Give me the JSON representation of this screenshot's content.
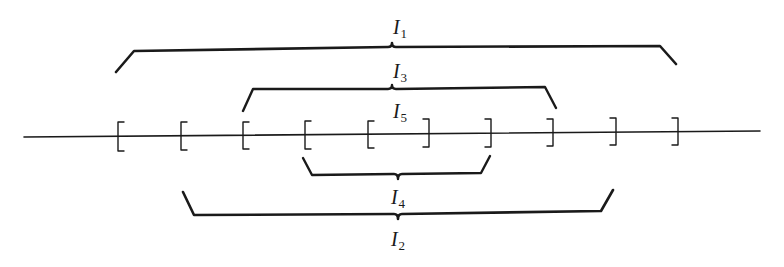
{
  "diagram": {
    "axis": {
      "x1": 24,
      "y1": 137,
      "x2": 760,
      "y2": 131
    },
    "left_brackets": [
      {
        "x": 118
      },
      {
        "x": 181
      },
      {
        "x": 243
      },
      {
        "x": 305
      },
      {
        "x": 368
      }
    ],
    "right_brackets": [
      {
        "x": 429
      },
      {
        "x": 491
      },
      {
        "x": 553
      },
      {
        "x": 616
      },
      {
        "x": 678
      }
    ],
    "intervals": [
      {
        "id": "I1",
        "name": "I",
        "sub": "1",
        "side": "above",
        "x_start": 116,
        "x_end": 676,
        "label_x": 400,
        "label_y": 28
      },
      {
        "id": "I3",
        "name": "I",
        "sub": "3",
        "side": "above",
        "x_start": 243,
        "x_end": 555,
        "label_x": 400,
        "label_y": 72
      },
      {
        "id": "I5",
        "name": "I",
        "sub": "5",
        "side": "above",
        "x_start": 368,
        "x_end": 429,
        "label_x": 400,
        "label_y": 112
      },
      {
        "id": "I4",
        "name": "I",
        "sub": "4",
        "side": "below",
        "x_start": 303,
        "x_end": 490,
        "label_x": 398,
        "label_y": 198
      },
      {
        "id": "I2",
        "name": "I",
        "sub": "2",
        "side": "below",
        "x_start": 183,
        "x_end": 613,
        "label_x": 398,
        "label_y": 240
      }
    ],
    "labels": {
      "I1": {
        "name": "I",
        "sub": "1"
      },
      "I2": {
        "name": "I",
        "sub": "2"
      },
      "I3": {
        "name": "I",
        "sub": "3"
      },
      "I4": {
        "name": "I",
        "sub": "4"
      },
      "I5": {
        "name": "I",
        "sub": "5"
      }
    },
    "colors": {
      "ink": "#1a1a1a",
      "background": "#ffffff"
    }
  }
}
